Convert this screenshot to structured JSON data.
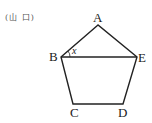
{
  "source_label": "(山 口)",
  "figure": {
    "type": "pentagon",
    "stroke_color": "#222222",
    "vertices": [
      {
        "name": "A",
        "x": 98,
        "y": 25
      },
      {
        "name": "B",
        "x": 61,
        "y": 57
      },
      {
        "name": "C",
        "x": 73,
        "y": 104
      },
      {
        "name": "D",
        "x": 123,
        "y": 104
      },
      {
        "name": "E",
        "x": 137,
        "y": 57
      }
    ],
    "diagonal": [
      "B",
      "E"
    ],
    "angle_label": "x",
    "angle_at": "B",
    "labels": {
      "A": "A",
      "B": "B",
      "C": "C",
      "D": "D",
      "E": "E"
    }
  }
}
